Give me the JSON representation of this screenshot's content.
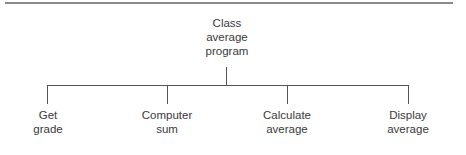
{
  "diagram": {
    "type": "hierarchy-chart",
    "root": {
      "lines": [
        "Class",
        "average",
        "program"
      ]
    },
    "children": [
      {
        "lines": [
          "Get",
          "grade"
        ]
      },
      {
        "lines": [
          "Computer",
          "sum"
        ]
      },
      {
        "lines": [
          "Calculate",
          "average"
        ]
      },
      {
        "lines": [
          "Display",
          "average"
        ]
      }
    ]
  }
}
